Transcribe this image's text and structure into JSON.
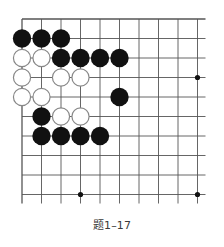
{
  "caption": "题1–17",
  "board": {
    "origin_x": 22,
    "origin_y": 19,
    "spacing": 19.5,
    "cols": 10,
    "rows": 10,
    "extend_right": 8,
    "extend_bottom": 9,
    "line_color": "#555555",
    "edge_top": true,
    "edge_left": true,
    "star_points": [
      [
        3,
        9
      ],
      [
        9,
        9
      ],
      [
        9,
        3
      ]
    ],
    "stones": {
      "black": [
        [
          0,
          1
        ],
        [
          1,
          1
        ],
        [
          2,
          1
        ],
        [
          2,
          2
        ],
        [
          3,
          2
        ],
        [
          4,
          2
        ],
        [
          5,
          2
        ],
        [
          5,
          4
        ],
        [
          1,
          5
        ],
        [
          1,
          6
        ],
        [
          2,
          6
        ],
        [
          3,
          6
        ],
        [
          4,
          6
        ]
      ],
      "white": [
        [
          0,
          2
        ],
        [
          1,
          2
        ],
        [
          0,
          3
        ],
        [
          2,
          3
        ],
        [
          3,
          3
        ],
        [
          0,
          4
        ],
        [
          1,
          4
        ],
        [
          2,
          5
        ],
        [
          3,
          5
        ]
      ]
    },
    "black_color": "#111111",
    "white_fill": "#ffffff",
    "white_stroke": "#888888"
  }
}
